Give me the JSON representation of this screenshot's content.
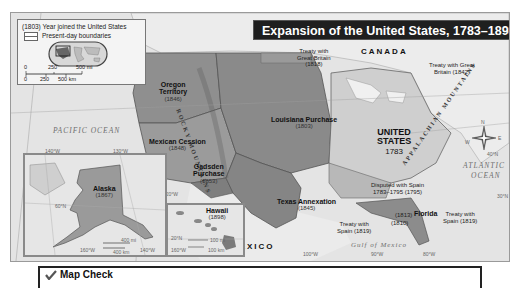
{
  "title": "Expansion of the United States, 1783–1898",
  "legend": {
    "year_note": "(1803) Year joined the United States",
    "boundaries_label": "Present-day boundaries",
    "scale_mi": [
      "0",
      "250",
      "500 mi"
    ],
    "scale_km": [
      "0",
      "250",
      "500 km"
    ]
  },
  "regions": {
    "oregon": {
      "name": "Oregon\nTerritory",
      "name_l1": "Oregon",
      "name_l2": "Territory",
      "year": "(1846)"
    },
    "mexican_cession": {
      "name": "Mexican Cession",
      "year": "(1848)"
    },
    "gadsden": {
      "name_l1": "Gadsden",
      "name_l2": "Purchase",
      "year": "(1853)"
    },
    "louisiana": {
      "name": "Louisiana Purchase",
      "year": "(1803)"
    },
    "texas": {
      "name": "Texas Annexation",
      "year": "(1845)"
    },
    "united_states": {
      "name_l1": "UNITED",
      "name_l2": "STATES",
      "year": "1783"
    },
    "florida": {
      "name": "Florida"
    },
    "alaska": {
      "name": "Alaska",
      "year": "(1867)"
    },
    "hawaii": {
      "name": "Hawaii",
      "year": "(1898)"
    }
  },
  "annotations": {
    "treaty_gb_1818": {
      "l1": "Treaty with",
      "l2": "Great Britain",
      "l3": "(1818)"
    },
    "treaty_gb_1842": {
      "l1": "Treaty with Great",
      "l2": "Britain (1842)"
    },
    "disputed_spain": {
      "l1": "Disputed with Spain",
      "l2": "1783–1795 (1795)"
    },
    "treaty_spain_1819_east": {
      "l1": "Treaty with",
      "l2": "Spain (1819)"
    },
    "treaty_spain_1819_west": {
      "l1": "Treaty with",
      "l2": "Spain (1819)"
    },
    "year_1813": "(1813)",
    "year_1810": "(1810)"
  },
  "places": {
    "canada": "CANADA",
    "mexico": "MEXICO",
    "pacific": "PACIFIC OCEAN",
    "atlantic_l1": "ATLANTIC",
    "atlantic_l2": "OCEAN",
    "gulf": "Gulf of Mexico",
    "rocky": "ROCKY MOUNTAINS",
    "appalachian": "APPALACHIAN MOUNTAINS"
  },
  "graticule": {
    "lon_140": "140°W",
    "lon_130": "130°W",
    "lon_120": "120°W",
    "lon_100": "100°W",
    "lon_90": "90°W",
    "lon_80": "80°W",
    "lat_30": "30°N",
    "lat_40": "40°N",
    "lat_20": "20°N",
    "lat_60": "60°N",
    "alaska_160": "160°W",
    "alaska_140": "140°W",
    "hawaii_160": "160°W"
  },
  "alaska_scale": {
    "mi": "400 mi",
    "km": "400 km",
    "zero": "0"
  },
  "hawaii_scale": {
    "mi": "100 mi",
    "km": "100 km",
    "zero": "0"
  },
  "compass": {
    "n": "N",
    "s": "S",
    "e": "E",
    "w": "W"
  },
  "map_check": {
    "title": "Map Check"
  },
  "colors": {
    "us_original": "#c9c9c9",
    "acquired": "#8f8f8f",
    "acquired_dark": "#7a7a7a",
    "foreign_land": "#e2e2e2",
    "water": "#eeeeee",
    "title_bg": "#1f1f1f"
  }
}
